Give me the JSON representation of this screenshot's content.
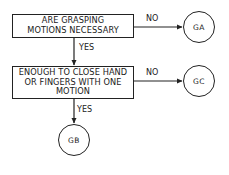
{
  "diagram": {
    "type": "flowchart",
    "decisions": [
      {
        "id": "q1",
        "text": "ARE GRASPING\nMOTIONS NECESSARY",
        "yes_target": "q2",
        "no_target": "GA"
      },
      {
        "id": "q2",
        "text": "ENOUGH TO CLOSE HAND\nOR FINGERS WITH ONE\nMOTION",
        "yes_target": "GB",
        "no_target": "GC"
      }
    ],
    "terminals": [
      {
        "id": "GA",
        "label": "GA"
      },
      {
        "id": "GC",
        "label": "GC"
      },
      {
        "id": "GB",
        "label": "GB"
      }
    ],
    "edge_labels": {
      "q1_no": "NO",
      "q1_yes": "YES",
      "q2_no": "NO",
      "q2_yes": "YES"
    },
    "colors": {
      "stroke": "#222222",
      "background": "#ffffff"
    }
  }
}
